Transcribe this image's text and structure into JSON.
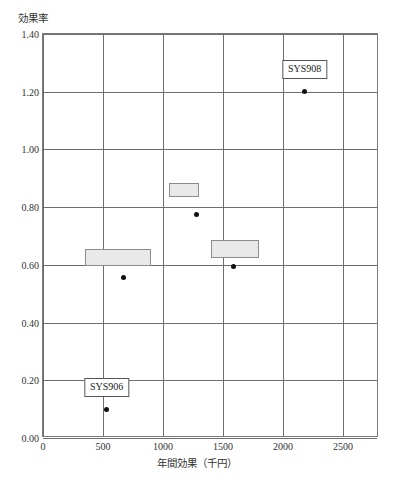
{
  "chart_data": {
    "type": "scatter",
    "title": "",
    "subtitle": "",
    "xlabel": "年間効果（千円）",
    "ylabel": "効果率",
    "xlim": [
      0,
      2800
    ],
    "ylim": [
      0.0,
      1.4
    ],
    "grid": true,
    "legend": null,
    "x_ticks": [
      0,
      500,
      1000,
      1500,
      2000,
      2500
    ],
    "x_tick_labels": [
      "0",
      "500",
      "1000",
      "1500",
      "2000",
      "2500"
    ],
    "y_ticks": [
      0.0,
      0.2,
      0.4,
      0.6,
      0.8,
      1.0,
      1.2,
      1.4
    ],
    "y_tick_labels": [
      "0.00",
      "0.20",
      "0.40",
      "0.60",
      "0.80",
      "1.00",
      "1.20",
      "1.40"
    ],
    "points": [
      {
        "name": "point-sys906",
        "x": 530,
        "y": 0.098
      },
      {
        "name": "point-a",
        "x": 670,
        "y": 0.555
      },
      {
        "name": "point-b",
        "x": 1280,
        "y": 0.775
      },
      {
        "name": "point-c",
        "x": 1590,
        "y": 0.593
      },
      {
        "name": "point-sys908",
        "x": 2180,
        "y": 1.2
      }
    ],
    "boxes": [
      {
        "name": "box-left",
        "x0": 350,
        "x1": 900,
        "y0": 0.595,
        "y1": 0.655
      },
      {
        "name": "box-middle",
        "x0": 1050,
        "x1": 1300,
        "y0": 0.835,
        "y1": 0.885
      },
      {
        "name": "box-right",
        "x0": 1400,
        "x1": 1800,
        "y0": 0.625,
        "y1": 0.685
      }
    ],
    "annotations": [
      {
        "name": "callout-sys908",
        "text": "SYS908",
        "x": 2180,
        "y": 1.245
      },
      {
        "name": "callout-sys906",
        "text": "SYS906",
        "x": 530,
        "y": 0.143
      }
    ],
    "colors": {
      "box_fill": "#e9e9e9",
      "box_border": "#8c8c8c",
      "point": "#111111",
      "grid": "#6e6e6e",
      "frame": "#7a7a7a",
      "callout_border": "#555555",
      "text": "#2b2b2b"
    }
  }
}
